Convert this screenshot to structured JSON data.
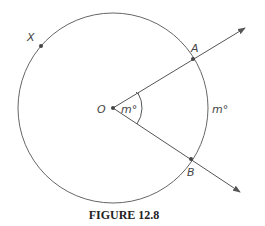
{
  "figure": {
    "caption": "FIGURE 12.8",
    "circle": {
      "cx": 113,
      "cy": 108,
      "r": 95
    },
    "points": {
      "O": {
        "label": "O",
        "x": 113,
        "y": 108
      },
      "A": {
        "label": "A",
        "x": 193,
        "y": 59
      },
      "B": {
        "label": "B",
        "x": 191,
        "y": 159
      },
      "X": {
        "label": "X",
        "x": 41,
        "y": 46
      }
    },
    "central_angle_label": "m°",
    "arc_label": "m°",
    "rays": [
      {
        "from": "O",
        "through": "A",
        "tip": [
          245,
          28
        ]
      },
      {
        "from": "O",
        "through": "B",
        "tip": [
          240,
          192
        ]
      }
    ],
    "colors": {
      "stroke": "#555555",
      "point": "#444444"
    }
  }
}
